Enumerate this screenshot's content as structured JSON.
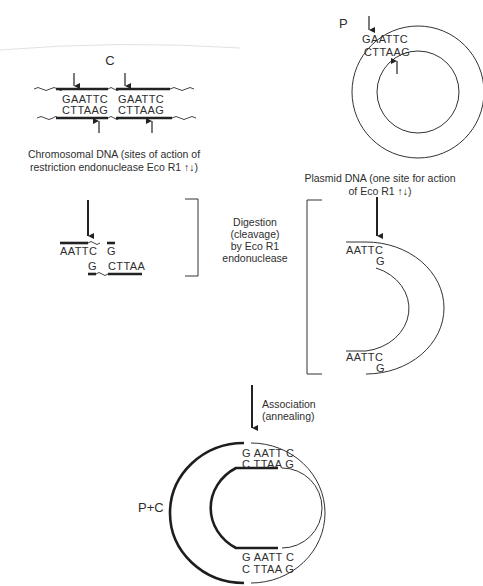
{
  "figure": {
    "chromosomal": {
      "label": "C",
      "top_strand_sites": [
        "GAATTC",
        "GAATTC"
      ],
      "bottom_strand_sites": [
        "CTTAAG",
        "CTTAAG"
      ],
      "caption_line1": "Chromosomal DNA (sites of action of",
      "caption_line2": "restriction endonuclease Eco R1 ↑↓)"
    },
    "plasmid": {
      "label": "P",
      "outer_seq": "GAATTC",
      "inner_seq": "CTTAAG",
      "caption_line1": "Plasmid DNA (one site for action",
      "caption_line2": "of Eco R1 ↑↓)"
    },
    "digestion": {
      "line1": "Digestion",
      "line2": "(cleavage)",
      "line3": "by  Eco R1",
      "line4": "endonuclease"
    },
    "chromosomal_fragment": {
      "top_left": "AATTC",
      "top_right": "G",
      "bottom_left": "G",
      "bottom_right": "CTTAA"
    },
    "plasmid_cut": {
      "top_outer": "AATTC",
      "top_inner": "G",
      "bottom_outer": "AATTC",
      "bottom_inner": "G"
    },
    "association": {
      "line1": "Association",
      "line2": "(annealing)"
    },
    "recombinant": {
      "label": "P+C",
      "top_outer": "G AATT C",
      "top_inner": "C TTAA G",
      "bottom_outer": "G AATT C",
      "bottom_inner": "C TTAA G"
    }
  }
}
